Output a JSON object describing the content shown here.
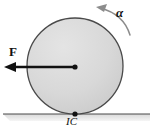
{
  "figure": {
    "background_color": "#ffffff"
  },
  "labels": {
    "force": "F",
    "angular_acceleration": "α",
    "instant_center": "IC"
  },
  "colors": {
    "disk_fill": "#d5d5d5",
    "disk_fill_light": "#e3e3e3",
    "disk_stroke": "#4a4a4a",
    "vector_stroke": "#111111",
    "ground_stroke": "#4a4a4a",
    "ground_shadow": "#cfcfcf",
    "arc_stroke": "#8c8c8c",
    "label_color": "#111111"
  },
  "geometry": {
    "disk_center_x": 75,
    "disk_center_y": 66,
    "disk_radius": 48,
    "ground_y": 114,
    "ground_x_start": 3,
    "ground_x_end": 150,
    "force_tip_x": 5,
    "force_tail_x": 75,
    "force_y": 67,
    "contact_point_x": 75,
    "contact_point_y": 114
  },
  "elements": {
    "disk_name": "rolling-disk",
    "force_vector_name": "force-vector-F",
    "alpha_arc_name": "angular-acceleration-arc",
    "ground_name": "ground-line",
    "center_dot_name": "disk-center-point",
    "contact_dot_name": "instant-center-point"
  }
}
